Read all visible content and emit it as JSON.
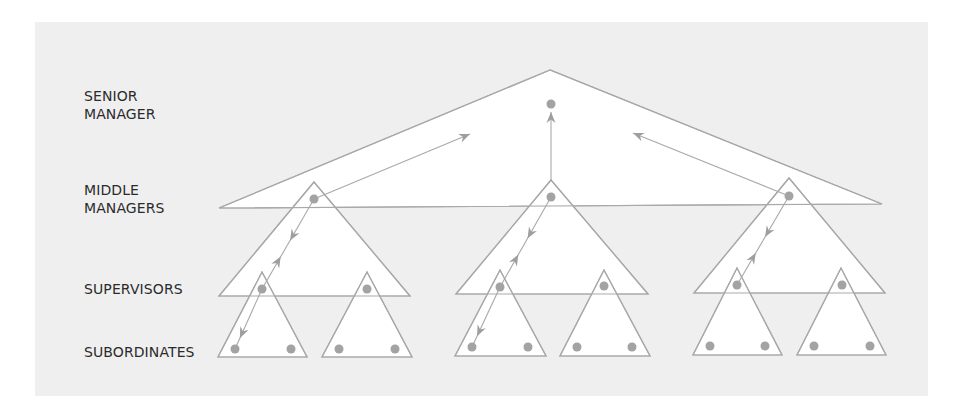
{
  "labels": {
    "senior_line1": "SENIOR",
    "senior_line2": "MANAGER",
    "middle_line1": "MIDDLE",
    "middle_line2": "MANAGERS",
    "supervisors": "SUPERVISORS",
    "subordinates": "SUBORDINATES"
  },
  "edge_glyph": ")",
  "colors": {
    "panel": "#efefef",
    "fill": "#ffffff",
    "stroke": "#a9a9a9",
    "dot": "#a3a3a3",
    "arrow": "#9e9e9e",
    "text": "#2b2b2b"
  },
  "diagram": {
    "senior_triangle": [
      [
        550,
        70
      ],
      [
        219,
        208
      ],
      [
        882,
        204
      ]
    ],
    "senior_dot": [
      551,
      104
    ],
    "middle_triangles": [
      [
        [
          314,
          182
        ],
        [
          219,
          296
        ],
        [
          410,
          296
        ]
      ],
      [
        [
          551,
          180
        ],
        [
          456,
          294
        ],
        [
          648,
          294
        ]
      ],
      [
        [
          789,
          178
        ],
        [
          694,
          293
        ],
        [
          885,
          293
        ]
      ]
    ],
    "middle_dots": [
      [
        314,
        199
      ],
      [
        551,
        197
      ],
      [
        789,
        196
      ]
    ],
    "supervisor_triangles": [
      [
        [
          262,
          272
        ],
        [
          218,
          357
        ],
        [
          307,
          357
        ]
      ],
      [
        [
          367,
          272
        ],
        [
          322,
          357
        ],
        [
          412,
          357
        ]
      ],
      [
        [
          500,
          270
        ],
        [
          455,
          356
        ],
        [
          546,
          356
        ]
      ],
      [
        [
          604,
          270
        ],
        [
          560,
          356
        ],
        [
          650,
          356
        ]
      ],
      [
        [
          737,
          268
        ],
        [
          693,
          355
        ],
        [
          782,
          355
        ]
      ],
      [
        [
          841,
          268
        ],
        [
          797,
          355
        ],
        [
          886,
          355
        ]
      ]
    ],
    "supervisor_dots": [
      [
        262,
        289
      ],
      [
        367,
        289
      ],
      [
        500,
        287
      ],
      [
        604,
        286
      ],
      [
        737,
        285
      ],
      [
        842,
        285
      ]
    ],
    "subordinate_dots": [
      [
        235,
        349
      ],
      [
        291,
        349
      ],
      [
        339,
        349
      ],
      [
        395,
        349
      ],
      [
        472,
        347
      ],
      [
        528,
        347
      ],
      [
        577,
        347
      ],
      [
        632,
        347
      ],
      [
        710,
        346
      ],
      [
        765,
        346
      ],
      [
        814,
        346
      ],
      [
        870,
        346
      ]
    ],
    "upward_arrows": [
      {
        "from": [
          314,
          199
        ],
        "to": [
          470,
          134
        ]
      },
      {
        "from": [
          551,
          180
        ],
        "to": [
          551,
          112
        ]
      },
      {
        "from": [
          789,
          196
        ],
        "to": [
          633,
          133
        ]
      }
    ],
    "two_way_links": [
      {
        "a": [
          314,
          199
        ],
        "b": [
          262,
          289
        ]
      },
      {
        "a": [
          551,
          197
        ],
        "b": [
          500,
          287
        ]
      },
      {
        "a": [
          789,
          196
        ],
        "b": [
          737,
          285
        ]
      }
    ],
    "downward_links": [
      {
        "from": [
          262,
          289
        ],
        "to": [
          235,
          349
        ]
      },
      {
        "from": [
          500,
          287
        ],
        "to": [
          472,
          347
        ]
      }
    ]
  }
}
